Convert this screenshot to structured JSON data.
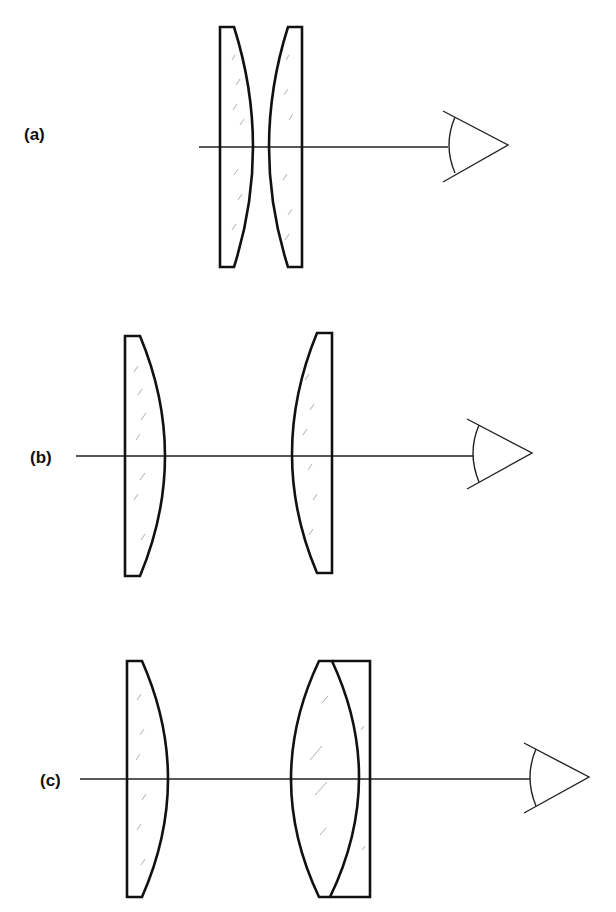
{
  "figure": {
    "panels": [
      {
        "id": "a",
        "label": "(a)",
        "arrangement": "two plano-convex lenses with curved faces touching"
      },
      {
        "id": "b",
        "label": "(b)",
        "arrangement": "two separated plano-convex lenses with curved faces facing each other"
      },
      {
        "id": "c",
        "label": "(c)",
        "arrangement": "plano-convex field lens and separated cemented doublet (biconvex + plano-concave)"
      }
    ],
    "colors": {
      "line": "#111111",
      "axis": "#222222",
      "hatch": "#9a9a9a",
      "background": "#ffffff"
    },
    "icons": [
      "eye-icon"
    ]
  }
}
